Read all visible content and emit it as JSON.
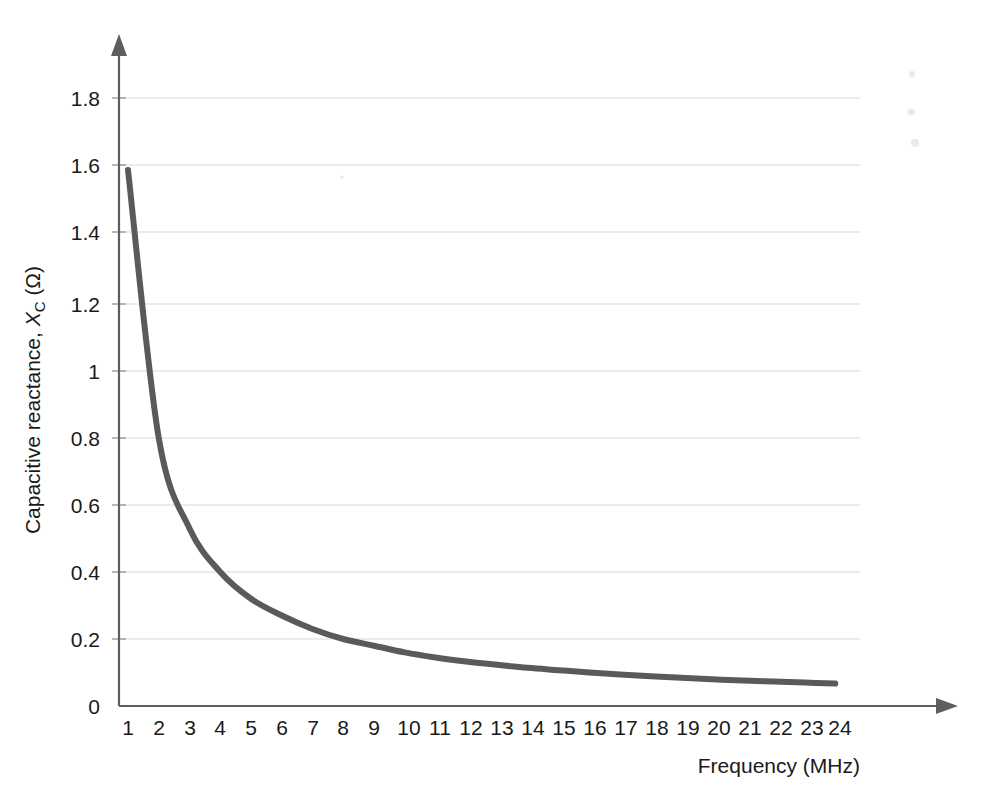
{
  "chart_data": {
    "type": "line",
    "title": "",
    "subtitle": "",
    "xlabel": "Frequency (MHz)",
    "ylabel": "Capacitive reactance, X_C (Ω)",
    "ylabel_parts": {
      "lead": "Capacitive reactance, ",
      "symbol": "X",
      "subscript": "C",
      "units": " (Ω)"
    },
    "grid": true,
    "legend": "none",
    "xlim": [
      0,
      24
    ],
    "ylim": [
      0,
      1.9
    ],
    "xticks": [
      "1",
      "2",
      "3",
      "4",
      "5",
      "6",
      "7",
      "8",
      "9",
      "10",
      "11",
      "12",
      "13",
      "14",
      "15",
      "16",
      "17",
      "18",
      "19",
      "20",
      "21",
      "22",
      "23",
      "24"
    ],
    "yticks": [
      "0",
      "0.2",
      "0.4",
      "0.6",
      "0.8",
      "1",
      "1.2",
      "1.4",
      "1.6",
      "1.8"
    ],
    "series": [
      {
        "name": "Capacitive reactance",
        "color": "#5a5a5a",
        "x": [
          1,
          2,
          3,
          4,
          5,
          6,
          7,
          8,
          9,
          10,
          11,
          12,
          13,
          14,
          15,
          16,
          17,
          18,
          19,
          20,
          21,
          22,
          23,
          24
        ],
        "values": [
          1.6,
          0.8,
          0.53,
          0.4,
          0.32,
          0.27,
          0.23,
          0.2,
          0.18,
          0.16,
          0.145,
          0.133,
          0.123,
          0.114,
          0.107,
          0.1,
          0.094,
          0.089,
          0.084,
          0.08,
          0.076,
          0.073,
          0.07,
          0.067
        ]
      }
    ],
    "relation": "X_C = 1.6 / f",
    "annotations": []
  },
  "axes": {
    "x_axis_name": "frequency-axis",
    "y_axis_name": "capacitive-reactance-axis"
  }
}
